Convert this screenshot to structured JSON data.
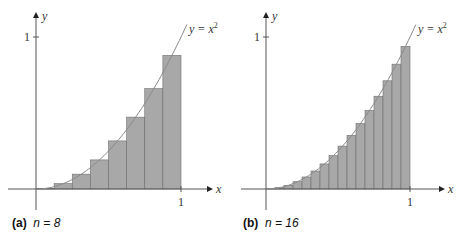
{
  "chart_data": [
    {
      "type": "bar",
      "title": "(a) n = 8",
      "panel_label": "(a)",
      "n_text": "n = 8",
      "n": 8,
      "function": "y = x^2",
      "curve_label": "y = x",
      "curve_label_exp": "2",
      "xlabel": "x",
      "ylabel": "y",
      "x_ticks": [
        "1"
      ],
      "y_ticks": [
        "1"
      ],
      "xlim": [
        0,
        1
      ],
      "ylim": [
        0,
        1
      ],
      "rule": "midpoint",
      "categories": [
        "0-0.125",
        "0.125-0.25",
        "0.25-0.375",
        "0.375-0.5",
        "0.5-0.625",
        "0.625-0.75",
        "0.75-0.875",
        "0.875-1"
      ],
      "values": [
        0.0039,
        0.0352,
        0.0977,
        0.1914,
        0.3164,
        0.4727,
        0.6602,
        0.8789
      ]
    },
    {
      "type": "bar",
      "title": "(b) n = 16",
      "panel_label": "(b)",
      "n_text": "n = 16",
      "n": 16,
      "function": "y = x^2",
      "curve_label": "y = x",
      "curve_label_exp": "2",
      "xlabel": "x",
      "ylabel": "y",
      "x_ticks": [
        "1"
      ],
      "y_ticks": [
        "1"
      ],
      "xlim": [
        0,
        1
      ],
      "ylim": [
        0,
        1
      ],
      "rule": "midpoint",
      "values": [
        0.001,
        0.0088,
        0.0244,
        0.0479,
        0.0791,
        0.1182,
        0.165,
        0.2197,
        0.2822,
        0.3525,
        0.4307,
        0.5166,
        0.6104,
        0.7119,
        0.8213,
        0.9385
      ]
    }
  ],
  "style": {
    "bar_fill": "#a8a8a8",
    "bar_stroke": "#6e6e6e",
    "axis": "#555555",
    "curve": "#8a8a8a"
  }
}
